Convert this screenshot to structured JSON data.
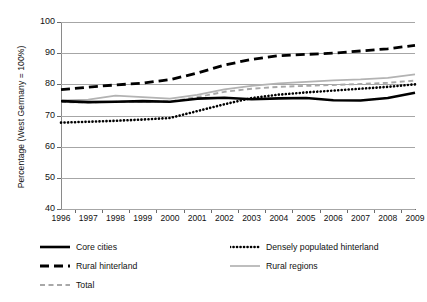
{
  "chart_data": {
    "type": "line",
    "title": "",
    "xlabel": "",
    "ylabel": "Percentage (West Germany = 100%)",
    "x": [
      1996,
      1997,
      1998,
      1999,
      2000,
      2001,
      2002,
      2003,
      2004,
      2005,
      2006,
      2007,
      2008,
      2009
    ],
    "categories": [
      "1996",
      "1997",
      "1998",
      "1999",
      "2000",
      "2001",
      "2002",
      "2003",
      "2004",
      "2005",
      "2006",
      "2007",
      "2008",
      "2009"
    ],
    "xlim": [
      1996,
      2009
    ],
    "ylim": [
      40,
      100
    ],
    "yticks": [
      40,
      50,
      60,
      70,
      80,
      90,
      100
    ],
    "grid": true,
    "legend_position": "below",
    "series": [
      {
        "name": "Core cities",
        "style": "solid-thick",
        "color": "#000000",
        "values": [
          74.6,
          74.3,
          74.4,
          74.6,
          74.4,
          75.4,
          75.7,
          75.2,
          75.5,
          75.6,
          74.9,
          74.8,
          75.6,
          77.3
        ]
      },
      {
        "name": "Densely populated hinterland",
        "style": "dotted",
        "color": "#000000",
        "values": [
          67.7,
          68.0,
          68.3,
          68.7,
          69.2,
          71.4,
          73.6,
          75.6,
          76.7,
          77.4,
          78.0,
          78.6,
          79.2,
          80.0
        ]
      },
      {
        "name": "Rural hinterland",
        "style": "long-dash",
        "color": "#000000",
        "values": [
          78.3,
          79.1,
          79.8,
          80.4,
          81.5,
          83.6,
          86.2,
          88.0,
          89.2,
          89.6,
          90.0,
          90.7,
          91.4,
          92.5
        ]
      },
      {
        "name": "Rural regions",
        "style": "solid-light",
        "color": "#b3b3b3",
        "values": [
          74.9,
          75.1,
          76.4,
          75.9,
          75.4,
          76.6,
          78.4,
          79.5,
          80.3,
          80.8,
          81.3,
          81.6,
          82.1,
          83.2
        ]
      },
      {
        "name": "Total",
        "style": "gray-dash",
        "color": "#a8a8a8",
        "values": [
          74.3,
          74.2,
          74.4,
          74.5,
          74.5,
          75.9,
          77.6,
          78.6,
          79.2,
          79.5,
          79.8,
          80.1,
          80.5,
          81.2
        ]
      }
    ]
  },
  "axis": {
    "y_tick_labels": [
      "100",
      "90",
      "80",
      "70",
      "60",
      "50",
      "40"
    ],
    "x_tick_labels": [
      "1996",
      "1997",
      "1998",
      "1999",
      "2000",
      "2001",
      "2002",
      "2003",
      "2004",
      "2005",
      "2006",
      "2007",
      "2008",
      "2009"
    ],
    "y_axis_title": "Percentage (West Germany = 100%)"
  },
  "legend": {
    "items": [
      {
        "label": "Core cities",
        "style": "solid-thick"
      },
      {
        "label": "Densely populated hinterland",
        "style": "dotted"
      },
      {
        "label": "Rural hinterland",
        "style": "long-dash"
      },
      {
        "label": "Rural regions",
        "style": "solid-light"
      },
      {
        "label": "Total",
        "style": "gray-dash"
      }
    ]
  }
}
